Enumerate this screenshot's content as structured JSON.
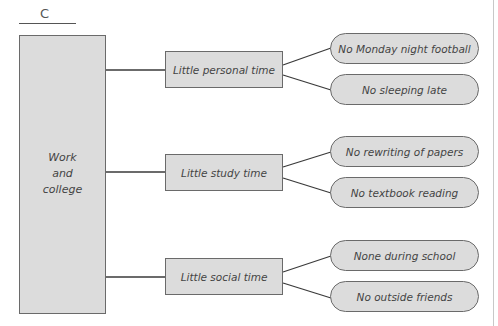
{
  "diagram": {
    "label": "C",
    "root": {
      "text": "Work\nand\ncollege"
    },
    "branches": [
      {
        "label": "Little personal time",
        "leaves": [
          "No Monday night football",
          "No sleeping late"
        ]
      },
      {
        "label": "Little study time",
        "leaves": [
          "No rewriting of papers",
          "No textbook reading"
        ]
      },
      {
        "label": "Little social time",
        "leaves": [
          "None during school",
          "No outside friends"
        ]
      }
    ],
    "colors": {
      "box_fill": "#dcdcdc",
      "stroke": "#6a6a6a",
      "text": "#444444"
    }
  }
}
